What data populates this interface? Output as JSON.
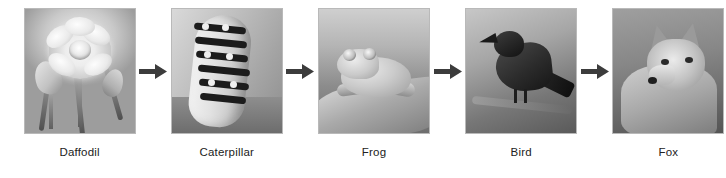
{
  "diagram": {
    "type": "food-chain-sequence",
    "direction": "left-to-right",
    "arrow_icon": "arrow-right-icon",
    "nodes": [
      {
        "id": "daffodil",
        "caption": "Daffodil",
        "image": "photo-daffodil",
        "alt": "Grayscale photo of a daffodil flower in bloom"
      },
      {
        "id": "caterpillar",
        "caption": "Caterpillar",
        "image": "photo-caterpillar",
        "alt": "Grayscale photo of a banded caterpillar on a leaf"
      },
      {
        "id": "frog",
        "caption": "Frog",
        "image": "photo-frog",
        "alt": "Grayscale photo of a frog sitting on a leaf"
      },
      {
        "id": "bird",
        "caption": "Bird",
        "image": "photo-bird",
        "alt": "Grayscale photo of a dark bird perched on a branch, beak open"
      },
      {
        "id": "fox",
        "caption": "Fox",
        "image": "photo-fox",
        "alt": "Grayscale photo of a fox head and body facing left"
      }
    ]
  },
  "colors": {
    "background": "#ffffff",
    "caption_text": "#222222",
    "arrow_fill": "#3c3c3c",
    "photo_border": "#b9b9b9"
  }
}
